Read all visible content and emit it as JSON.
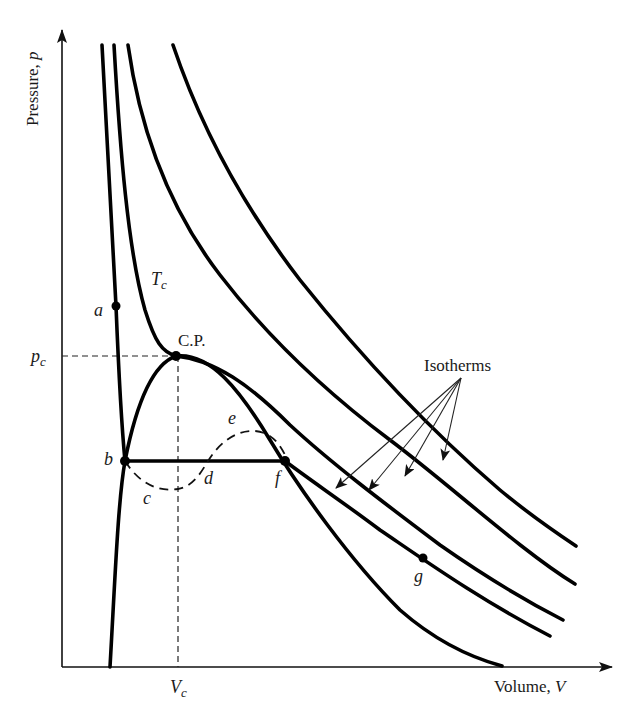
{
  "diagram": {
    "type": "p-V isotherm diagram (van der Waals / real gas)",
    "axes": {
      "y_label": "Pressure, p",
      "y_label_text": "Pressure, ",
      "y_label_var": "p",
      "x_label_text": "Volume, ",
      "x_label_var": "V",
      "y_tick_label": "p",
      "y_tick_sub": "c",
      "x_tick_label": "V",
      "x_tick_sub": "c"
    },
    "labels": {
      "critical_point": "C.P.",
      "critical_isotherm": "T",
      "critical_isotherm_sub": "c",
      "isotherms_callout": "Isotherms"
    },
    "points": [
      {
        "id": "a",
        "label": "a",
        "marker": true
      },
      {
        "id": "b",
        "label": "b",
        "marker": true
      },
      {
        "id": "c",
        "label": "c",
        "marker": false
      },
      {
        "id": "d",
        "label": "d",
        "marker": false
      },
      {
        "id": "e",
        "label": "e",
        "marker": false
      },
      {
        "id": "f",
        "label": "f",
        "marker": true
      },
      {
        "id": "g",
        "label": "g",
        "marker": true
      }
    ],
    "curves": [
      {
        "name": "isotherm-high-1",
        "description": "highest temperature isotherm"
      },
      {
        "name": "isotherm-high-2",
        "description": "second supercritical isotherm"
      },
      {
        "name": "isotherm-critical",
        "description": "critical isotherm Tc through C.P."
      },
      {
        "name": "isotherm-subcritical",
        "description": "subcritical isotherm a-b-f-g with flat tie line b-f"
      },
      {
        "name": "coexistence-dome",
        "description": "liquid-vapor coexistence boundary through b, C.P., f"
      },
      {
        "name": "van-der-waals-loop",
        "description": "dashed loop b-c-d-e-f"
      }
    ],
    "colors": {
      "line": "#000000",
      "background": "#ffffff"
    }
  }
}
